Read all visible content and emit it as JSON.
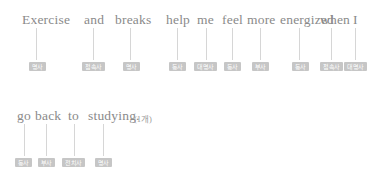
{
  "document": {
    "lines": [
      {
        "id": "line-1",
        "top": 12,
        "text": "Exercise and breaks help me feel more energized when I",
        "words": [
          {
            "label": "Exercise",
            "left": 22,
            "connector_x": 36,
            "tag": "명사",
            "tag_left": 29,
            "tag_width": 17
          },
          {
            "label": "and",
            "left": 84,
            "connector_x": 93,
            "tag": "접속사",
            "tag_left": 82,
            "tag_width": 23
          },
          {
            "label": "breaks",
            "left": 115,
            "connector_x": 130,
            "tag": "명사",
            "tag_left": 123,
            "tag_width": 17
          },
          {
            "label": "help",
            "left": 166,
            "connector_x": 177,
            "tag": "동사",
            "tag_left": 169,
            "tag_width": 17
          },
          {
            "label": "me",
            "left": 197,
            "connector_x": 206,
            "tag": "대명사",
            "tag_left": 194,
            "tag_width": 23
          },
          {
            "label": "feel",
            "left": 222,
            "connector_x": 232,
            "tag": "동사",
            "tag_left": 224,
            "tag_width": 17
          },
          {
            "label": "more",
            "left": 247,
            "connector_x": 260,
            "tag": "부사",
            "tag_left": 252,
            "tag_width": 17
          },
          {
            "label": "energized",
            "left": 280,
            "connector_x": 299,
            "tag": "동사",
            "tag_left": 292,
            "tag_width": 17
          },
          {
            "label": "when",
            "left": 320,
            "connector_x": 331,
            "tag": "접속사",
            "tag_left": 320,
            "tag_width": 23
          },
          {
            "label": "I",
            "left": 353,
            "connector_x": 355,
            "tag": "대명사",
            "tag_left": 344,
            "tag_width": 23
          }
        ]
      },
      {
        "id": "line-2",
        "top": 108,
        "text": "go back to studying.",
        "count_note": "(1개)",
        "count_note_left": 134,
        "words": [
          {
            "label": "go",
            "left": 17,
            "connector_x": 24,
            "tag": "동사",
            "tag_left": 15,
            "tag_width": 17
          },
          {
            "label": "back",
            "left": 35,
            "connector_x": 46,
            "tag": "부사",
            "tag_left": 38,
            "tag_width": 17
          },
          {
            "label": "to",
            "left": 68,
            "connector_x": 74,
            "tag": "전치사",
            "tag_left": 62,
            "tag_width": 23
          },
          {
            "label": "studying.",
            "left": 88,
            "connector_x": 103,
            "tag": "명사",
            "tag_left": 95,
            "tag_width": 17
          }
        ]
      }
    ],
    "geometry": {
      "connector_top_offset": 16,
      "connector_height": 32,
      "tag_top_offset": 50
    },
    "colors": {
      "text": "#8a8a8a",
      "tag_background": "#c6c6c6",
      "tag_text": "#ffffff",
      "connector": "#d6d6d6",
      "page_background": "#ffffff"
    }
  }
}
